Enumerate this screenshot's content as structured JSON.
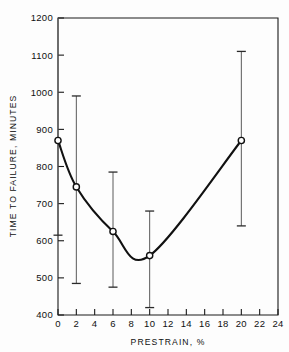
{
  "chart_data": {
    "type": "line",
    "title": "",
    "xlabel": "PRESTRAIN, %",
    "ylabel": "TIME TO FAILURE, MINUTES",
    "xlim": [
      0,
      24
    ],
    "ylim": [
      400,
      1200
    ],
    "xticks": [
      0,
      2,
      4,
      6,
      8,
      10,
      12,
      14,
      16,
      18,
      20,
      22,
      24
    ],
    "xtick_labels": [
      "0",
      "2",
      "4",
      "6",
      "8",
      "10",
      "12",
      "14",
      "16",
      "18",
      "20",
      "22",
      "24"
    ],
    "yticks": [
      400,
      500,
      600,
      700,
      800,
      900,
      1000,
      1100,
      1200
    ],
    "ytick_labels": [
      "400",
      "500",
      "600",
      "700",
      "800",
      "900",
      "1000",
      "1100",
      "1200"
    ],
    "grid": false,
    "legend": null,
    "x": [
      0,
      2,
      6,
      10,
      20
    ],
    "values": [
      870,
      745,
      625,
      560,
      870
    ],
    "error_bars": [
      {
        "x": 0,
        "y": 870,
        "low": 615,
        "high": 1200
      },
      {
        "x": 2,
        "y": 745,
        "low": 485,
        "high": 990
      },
      {
        "x": 6,
        "y": 625,
        "low": 475,
        "high": 785
      },
      {
        "x": 10,
        "y": 560,
        "low": 420,
        "high": 680
      },
      {
        "x": 20,
        "y": 870,
        "low": 640,
        "high": 1110
      }
    ],
    "series": [
      {
        "name": "time-to-failure",
        "marker": "open-circle",
        "values": [
          870,
          745,
          625,
          560,
          870
        ]
      }
    ]
  },
  "axis": {
    "x_title": "PRESTRAIN, %",
    "y_title": "TIME TO FAILURE, MINUTES"
  }
}
